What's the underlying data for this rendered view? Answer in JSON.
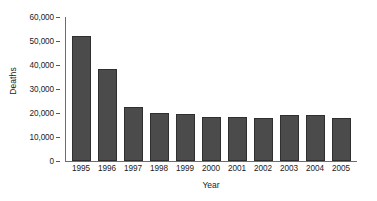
{
  "chart_data": {
    "type": "bar",
    "title": "",
    "xlabel": "Year",
    "ylabel": "Deaths",
    "categories": [
      "1995",
      "1996",
      "1997",
      "1998",
      "1999",
      "2000",
      "2001",
      "2002",
      "2003",
      "2004",
      "2005"
    ],
    "values": [
      52000,
      38500,
      22500,
      20000,
      19500,
      18500,
      18200,
      17800,
      19000,
      19200,
      18000
    ],
    "ylim": [
      0,
      60000
    ],
    "ytick_labels": [
      "60,000",
      "50,000",
      "40,000",
      "30,000",
      "20,000",
      "10,000",
      "0"
    ],
    "ytick_values": [
      60000,
      50000,
      40000,
      30000,
      20000,
      10000,
      0
    ],
    "grid": false,
    "legend": "none",
    "series": [
      {
        "name": "Deaths",
        "values": [
          52000,
          38500,
          22500,
          20000,
          19500,
          18500,
          18200,
          17800,
          19000,
          19200,
          18000
        ]
      }
    ],
    "colors": {
      "bar_fill": "#4b4b4b",
      "bar_border": "#2f2f2f",
      "axis": "#6d6d6d",
      "text": "#1b1b1b",
      "background": "#ffffff"
    }
  }
}
